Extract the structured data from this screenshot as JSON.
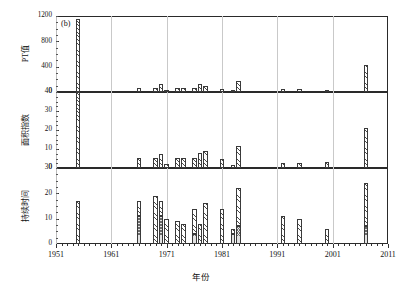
{
  "figure": {
    "panel_tag": "(b)",
    "xlabel": "年份",
    "x_ticklabels": [
      "1951",
      "1961",
      "1971",
      "1981",
      "1991",
      "2001",
      "2011"
    ],
    "x_tickvalues": [
      1951,
      1961,
      1971,
      1981,
      1991,
      2001,
      2011
    ],
    "xlim": [
      1951,
      2011
    ]
  },
  "chart_data": [
    {
      "type": "bar",
      "panel": "top",
      "title": "(b)",
      "ylabel": "PT值",
      "xlabel": "年份",
      "ylim": [
        0,
        1200
      ],
      "yticks": [
        0,
        400,
        800,
        1200
      ],
      "xlim": [
        1951,
        2011
      ],
      "xticks": [
        1951,
        1961,
        1971,
        1981,
        1991,
        2001,
        2011
      ],
      "grid": "vertical-only",
      "legend": "none",
      "x": [
        1955,
        1966,
        1969,
        1970,
        1971,
        1973,
        1974,
        1976,
        1977,
        1978,
        1981,
        1983,
        1984,
        1992,
        1995,
        2000,
        2007
      ],
      "values": [
        1160,
        60,
        65,
        120,
        20,
        65,
        70,
        60,
        130,
        100,
        55,
        30,
        175,
        45,
        45,
        12,
        430
      ]
    },
    {
      "type": "bar",
      "panel": "middle",
      "ylabel": "面积指数",
      "xlabel": "年份",
      "ylim": [
        0,
        40
      ],
      "yticks": [
        0,
        10,
        20,
        30,
        40
      ],
      "xlim": [
        1951,
        2011
      ],
      "xticks": [
        1951,
        1961,
        1971,
        1981,
        1991,
        2001,
        2011
      ],
      "grid": "vertical-only",
      "legend": "none",
      "x": [
        1955,
        1966,
        1969,
        1970,
        1971,
        1973,
        1974,
        1976,
        1977,
        1978,
        1981,
        1983,
        1984,
        1992,
        1995,
        2000,
        2007
      ],
      "values": [
        40,
        5.5,
        5.2,
        7.5,
        2.2,
        5.5,
        5.5,
        5.5,
        8,
        9,
        4.5,
        1.5,
        11.5,
        2.5,
        2.5,
        3,
        21
      ]
    },
    {
      "type": "bar",
      "panel": "bottom",
      "ylabel": "持续时间",
      "xlabel": "年份",
      "ylim": [
        0,
        30
      ],
      "yticks": [
        0,
        10,
        20,
        30
      ],
      "xlim": [
        1951,
        2011
      ],
      "xticks": [
        1951,
        1961,
        1971,
        1981,
        1991,
        2001,
        2011
      ],
      "grid": "vertical-only",
      "legend": "none",
      "stacked": true,
      "x": [
        1955,
        1966,
        1969,
        1970,
        1971,
        1973,
        1974,
        1976,
        1977,
        1978,
        1981,
        1983,
        1984,
        1992,
        1995,
        2000,
        2007
      ],
      "series": [
        {
          "name": "base",
          "values": [
            0,
            11,
            0,
            11,
            0,
            0,
            0,
            4,
            0,
            0,
            0,
            4,
            7,
            0,
            0,
            0,
            7
          ]
        },
        {
          "name": "top",
          "values": [
            17,
            6,
            19,
            6,
            10,
            9,
            8,
            10,
            8,
            16,
            14,
            2,
            15,
            11,
            10,
            6,
            17
          ]
        }
      ],
      "totals": [
        17,
        17,
        19,
        17,
        10,
        9,
        8,
        14,
        8,
        16,
        14,
        6,
        22,
        11,
        10,
        6,
        24
      ]
    }
  ],
  "axes": {
    "top": {
      "label": "PT值",
      "ticks": [
        "0",
        "400",
        "800",
        "1200"
      ]
    },
    "middle": {
      "label": "面积指数",
      "ticks": [
        "0",
        "10",
        "20",
        "30",
        "40"
      ]
    },
    "bottom": {
      "label": "持续时间",
      "ticks": [
        "0",
        "10",
        "20",
        "30"
      ]
    }
  }
}
